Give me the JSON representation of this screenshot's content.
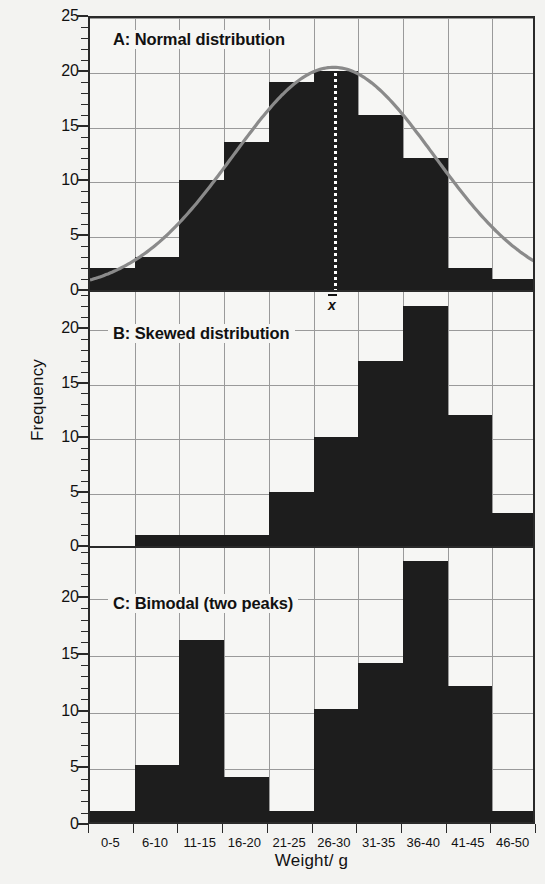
{
  "figure": {
    "x_axis_label": "Weight/ g",
    "y_axis_label": "Frequency"
  },
  "panels": [
    {
      "id": "panel-a",
      "title": "A: Normal distribution",
      "ylim": [
        0,
        25
      ],
      "yticks": [
        0,
        5,
        10,
        15,
        20,
        25
      ],
      "has_curve": true,
      "has_mean_marker": true,
      "mean_label": "x"
    },
    {
      "id": "panel-b",
      "title": "B: Skewed distribution",
      "ylim": [
        0,
        23.5
      ],
      "yticks": [
        0,
        5,
        10,
        15,
        20
      ],
      "has_curve": false,
      "has_mean_marker": false
    },
    {
      "id": "panel-c",
      "title": "C: Bimodal (two peaks)",
      "ylim": [
        0,
        24.5
      ],
      "yticks": [
        0,
        5,
        10,
        15,
        20
      ],
      "has_curve": false,
      "has_mean_marker": false
    }
  ],
  "chart_data": [
    {
      "type": "bar",
      "title": "A: Normal distribution",
      "xlabel": "Weight/ g",
      "ylabel": "Frequency",
      "categories": [
        "0-5",
        "6-10",
        "11-15",
        "16-20",
        "21-25",
        "26-30",
        "31-35",
        "36-40",
        "41-45",
        "46-50"
      ],
      "values": [
        2,
        3,
        10,
        13.5,
        19,
        20,
        16,
        12,
        2,
        1
      ],
      "ylim": [
        0,
        25
      ],
      "yticks": [
        0,
        5,
        10,
        15,
        20,
        25
      ],
      "grid": true,
      "legend": "none",
      "annotations": [
        {
          "text": "x̄",
          "type": "mean-marker",
          "x_category": "26-30",
          "note": "dotted vertical line at the mean"
        },
        {
          "text": "normal curve overlay",
          "type": "curve",
          "peak_value": 20.5,
          "peak_x_category": "26-30"
        }
      ]
    },
    {
      "type": "bar",
      "title": "B: Skewed distribution",
      "xlabel": "Weight/ g",
      "ylabel": "Frequency",
      "categories": [
        "0-5",
        "6-10",
        "11-15",
        "16-20",
        "21-25",
        "26-30",
        "31-35",
        "36-40",
        "41-45",
        "46-50"
      ],
      "values": [
        0,
        1,
        1,
        1,
        5,
        10,
        17,
        22,
        12,
        3
      ],
      "ylim": [
        0,
        23.5
      ],
      "yticks": [
        0,
        5,
        10,
        15,
        20
      ],
      "grid": true,
      "legend": "none"
    },
    {
      "type": "bar",
      "title": "C: Bimodal (two peaks)",
      "xlabel": "Weight/ g",
      "ylabel": "Frequency",
      "categories": [
        "0-5",
        "6-10",
        "11-15",
        "16-20",
        "21-25",
        "26-30",
        "31-35",
        "36-40",
        "41-45",
        "46-50"
      ],
      "values": [
        1,
        5,
        16,
        4,
        1,
        10,
        14,
        23,
        12,
        1
      ],
      "ylim": [
        0,
        24.5
      ],
      "yticks": [
        0,
        5,
        10,
        15,
        20
      ],
      "grid": true,
      "legend": "none"
    }
  ],
  "colors": {
    "bar": "#1d1d1d",
    "background": "#f3f3f1",
    "plot_background": "#f6f6f4",
    "grid": "#9a9a9a",
    "axis": "#2a2a2a",
    "curve": "#8a8a8a"
  }
}
